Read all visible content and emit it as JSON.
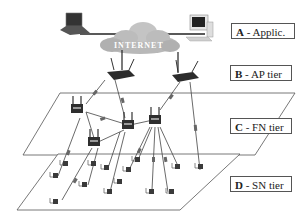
{
  "diagram": {
    "cloud_label": "INTERNET",
    "tiers": [
      {
        "letter": "A",
        "label": " - Applic."
      },
      {
        "letter": "B",
        "label": " - AP tier"
      },
      {
        "letter": "C",
        "label": " - FN tier"
      },
      {
        "letter": "D",
        "label": " - SN tier"
      }
    ],
    "devices": {
      "application": [
        "laptop",
        "desktop-pc"
      ],
      "ap_tier_routers": 2,
      "fn_tier_routers": 4,
      "sn_tier_sensor_nodes": 14
    },
    "colors": {
      "line": "#333333",
      "cloud": "#b8b8b8",
      "device": "#3a3a3a",
      "box_border": "#555555"
    }
  }
}
